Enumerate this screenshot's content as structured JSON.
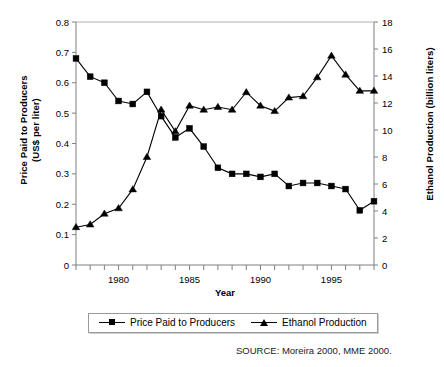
{
  "chart_data": {
    "type": "line",
    "title": "",
    "xlabel": "Year",
    "ylabel": "Price Paid to Producers\n(US$ per liter)",
    "ylabel_right": "Ethanol Production (billion liters)",
    "x": [
      1977,
      1978,
      1979,
      1980,
      1981,
      1982,
      1983,
      1984,
      1985,
      1986,
      1987,
      1988,
      1989,
      1990,
      1991,
      1992,
      1993,
      1994,
      1995,
      1996,
      1997,
      1998
    ],
    "xlim": [
      1977,
      1998
    ],
    "xticks_major": [
      1980,
      1985,
      1990,
      1995
    ],
    "xtick_labels": [
      "1980",
      "1985",
      "1990",
      "1995"
    ],
    "ylim": [
      0,
      0.8
    ],
    "yticks": [
      0,
      0.1,
      0.2,
      0.3,
      0.4,
      0.5,
      0.6,
      0.7,
      0.8
    ],
    "ytick_labels": [
      "0",
      "0.1",
      "0.2",
      "0.3",
      "0.4",
      "0.5",
      "0.6",
      "0.7",
      "0.8"
    ],
    "ylim_right": [
      0,
      18
    ],
    "yticks_right": [
      0,
      2,
      4,
      6,
      8,
      10,
      12,
      14,
      16,
      18
    ],
    "ytick_labels_right": [
      "0",
      "2",
      "4",
      "6",
      "8",
      "10",
      "12",
      "14",
      "16",
      "18"
    ],
    "grid": false,
    "legend_position": "bottom",
    "series": [
      {
        "name": "Price Paid to Producers",
        "axis": "left",
        "marker": "square",
        "values": [
          0.68,
          0.62,
          0.6,
          0.54,
          0.53,
          0.57,
          0.49,
          0.42,
          0.45,
          0.39,
          0.32,
          0.3,
          0.3,
          0.29,
          0.3,
          0.26,
          0.27,
          0.27,
          0.26,
          0.25,
          0.18,
          0.21
        ]
      },
      {
        "name": "Ethanol Production",
        "axis": "right",
        "marker": "triangle",
        "values": [
          2.8,
          3.0,
          3.8,
          4.2,
          5.6,
          8.0,
          11.5,
          9.9,
          11.8,
          11.5,
          11.7,
          11.5,
          12.8,
          11.8,
          11.4,
          12.4,
          12.5,
          13.9,
          15.5,
          14.1,
          12.9,
          12.9
        ]
      }
    ]
  },
  "legend": {
    "items": [
      {
        "label": "Price Paid to Producers",
        "marker": "square"
      },
      {
        "label": "Ethanol Production",
        "marker": "triangle"
      }
    ]
  },
  "source": {
    "text": "SOURCE: Moreira 2000, MME 2000."
  }
}
